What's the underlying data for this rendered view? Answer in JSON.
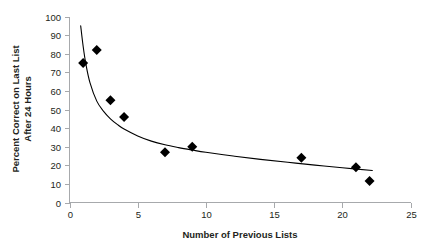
{
  "chart_data": {
    "type": "scatter",
    "title": "",
    "xlabel": "Number of Previous Lists",
    "ylabel_line1": "Percent Correct on Last List",
    "ylabel_line2": "After 24 Hours",
    "xlim": [
      0,
      25
    ],
    "ylim": [
      0,
      100
    ],
    "xticks": [
      0,
      5,
      10,
      15,
      20,
      25
    ],
    "xtick_labels": [
      "0",
      "5",
      "10",
      "15",
      "20",
      "25"
    ],
    "yticks": [
      0,
      10,
      20,
      30,
      40,
      50,
      60,
      70,
      80,
      90,
      100
    ],
    "ytick_labels": [
      "0",
      "10",
      "20",
      "30",
      "40",
      "50",
      "60",
      "70",
      "80",
      "90",
      "100"
    ],
    "grid": false,
    "legend": null,
    "marker": "diamond",
    "marker_color": "#000000",
    "curve_color": "#000000",
    "axis_color": "#a7a9ac",
    "x": [
      1,
      2,
      3,
      4,
      7,
      9,
      17,
      21,
      22
    ],
    "y": [
      75,
      82,
      55,
      46,
      27,
      30,
      24,
      19,
      11.5
    ],
    "points": [
      {
        "x": 1,
        "y": 75
      },
      {
        "x": 2,
        "y": 82
      },
      {
        "x": 3,
        "y": 55
      },
      {
        "x": 4,
        "y": 46
      },
      {
        "x": 7,
        "y": 27
      },
      {
        "x": 9,
        "y": 30
      },
      {
        "x": 17,
        "y": 24
      },
      {
        "x": 21,
        "y": 19
      },
      {
        "x": 22,
        "y": 11.5
      }
    ],
    "fit_curve": {
      "kind": "power",
      "note": "decaying power-law trend line drawn through the points",
      "x_start": 0.82,
      "x_end": 22.2,
      "samples": [
        {
          "x": 0.82,
          "y": 95.0
        },
        {
          "x": 1.0,
          "y": 84.0
        },
        {
          "x": 1.2,
          "y": 74.5
        },
        {
          "x": 1.5,
          "y": 64.5
        },
        {
          "x": 2.0,
          "y": 54.5
        },
        {
          "x": 2.5,
          "y": 49.0
        },
        {
          "x": 3.0,
          "y": 45.0
        },
        {
          "x": 3.5,
          "y": 42.0
        },
        {
          "x": 4.0,
          "y": 39.5
        },
        {
          "x": 5.0,
          "y": 35.8
        },
        {
          "x": 6.0,
          "y": 33.0
        },
        {
          "x": 7.0,
          "y": 31.0
        },
        {
          "x": 8.0,
          "y": 29.5
        },
        {
          "x": 9.0,
          "y": 28.2
        },
        {
          "x": 10.0,
          "y": 27.0
        },
        {
          "x": 12.0,
          "y": 25.0
        },
        {
          "x": 14.0,
          "y": 23.2
        },
        {
          "x": 16.0,
          "y": 21.6
        },
        {
          "x": 18.0,
          "y": 20.1
        },
        {
          "x": 20.0,
          "y": 18.7
        },
        {
          "x": 22.2,
          "y": 17.2
        }
      ]
    }
  }
}
